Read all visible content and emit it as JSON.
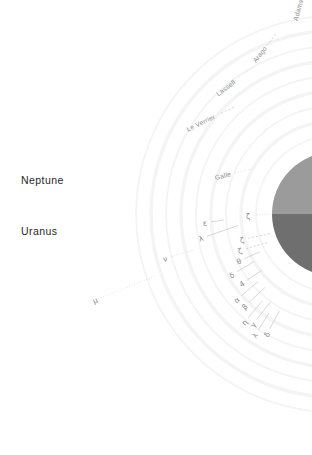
{
  "figure": {
    "background_color": "#ffffff",
    "planet": {
      "name": "planet-disc",
      "north_color": "#9b9b9b",
      "south_color": "#6f6f6f",
      "center_x": 334,
      "center_y": 214,
      "radius": 62
    },
    "bodies": [
      {
        "label": "Neptune",
        "x": 21,
        "y": 174
      },
      {
        "label": "Uranus",
        "x": 21,
        "y": 225
      }
    ],
    "neptune_rings": [
      {
        "label": "Galle",
        "x": 215,
        "y": 174,
        "angle": -14,
        "leader": "dotted",
        "leader_len": 16
      },
      {
        "label": "Le Verrier",
        "x": 187,
        "y": 126,
        "angle": -26,
        "leader": "dashed",
        "leader_len": 15
      },
      {
        "label": "Lassell",
        "x": 217,
        "y": 91,
        "angle": -38,
        "leader": "dotted",
        "leader_len": 17
      },
      {
        "label": "Arago",
        "x": 254,
        "y": 58,
        "angle": -52,
        "leader": "dashed",
        "leader_len": 14
      },
      {
        "label": "Adams",
        "x": 295,
        "y": 17,
        "angle": -74,
        "leader": "dashed",
        "leader_len": 13
      }
    ],
    "uranus_rings": [
      {
        "label": "μ",
        "x": 93,
        "y": 297,
        "angle": -22,
        "leader": "dotted",
        "leader_len": 58
      },
      {
        "label": "ν",
        "x": 163,
        "y": 255,
        "angle": -16,
        "leader": "dotted",
        "leader_len": 24
      },
      {
        "label": "ε",
        "x": 203,
        "y": 219,
        "angle": -8,
        "leader": "solid",
        "leader_len": 13
      },
      {
        "label": "λ",
        "x": 199,
        "y": 235,
        "angle": -19,
        "leader": "solid",
        "leader_len": 33
      },
      {
        "label": "ζ",
        "x": 240,
        "y": 236,
        "angle": -12,
        "leader": "dashed",
        "leader_len": 23
      },
      {
        "label": "ζ",
        "x": 238,
        "y": 247,
        "angle": -16,
        "leader": "dashed",
        "leader_len": 22
      },
      {
        "label": "ζ",
        "x": 246,
        "y": 212,
        "angle": -5,
        "leader": "dotted",
        "leader_len": 30
      },
      {
        "label": "θ",
        "x": 237,
        "y": 258,
        "angle": -24,
        "leader": "solid",
        "leader_len": 17
      },
      {
        "label": "δ",
        "x": 230,
        "y": 272,
        "angle": -31,
        "leader": "solid",
        "leader_len": 20
      },
      {
        "label": "4",
        "x": 240,
        "y": 281,
        "angle": -34,
        "leader": "solid",
        "leader_len": 18
      },
      {
        "label": "α",
        "x": 235,
        "y": 297,
        "angle": -40,
        "leader": "solid",
        "leader_len": 22
      },
      {
        "label": "β",
        "x": 243,
        "y": 304,
        "angle": -43,
        "leader": "solid",
        "leader_len": 22
      },
      {
        "label": "η",
        "x": 243,
        "y": 320,
        "angle": -50,
        "leader": "solid",
        "leader_len": 22
      },
      {
        "label": "γ",
        "x": 252,
        "y": 322,
        "angle": -53,
        "leader": "solid",
        "leader_len": 22
      },
      {
        "label": "λ",
        "x": 254,
        "y": 333,
        "angle": -58,
        "leader": "solid",
        "leader_len": 20
      },
      {
        "label": "δ",
        "x": 266,
        "y": 332,
        "angle": -62,
        "leader": "solid",
        "leader_len": 20
      }
    ],
    "ring_arcs": {
      "color": "#f4f4f4",
      "count": 9
    }
  }
}
